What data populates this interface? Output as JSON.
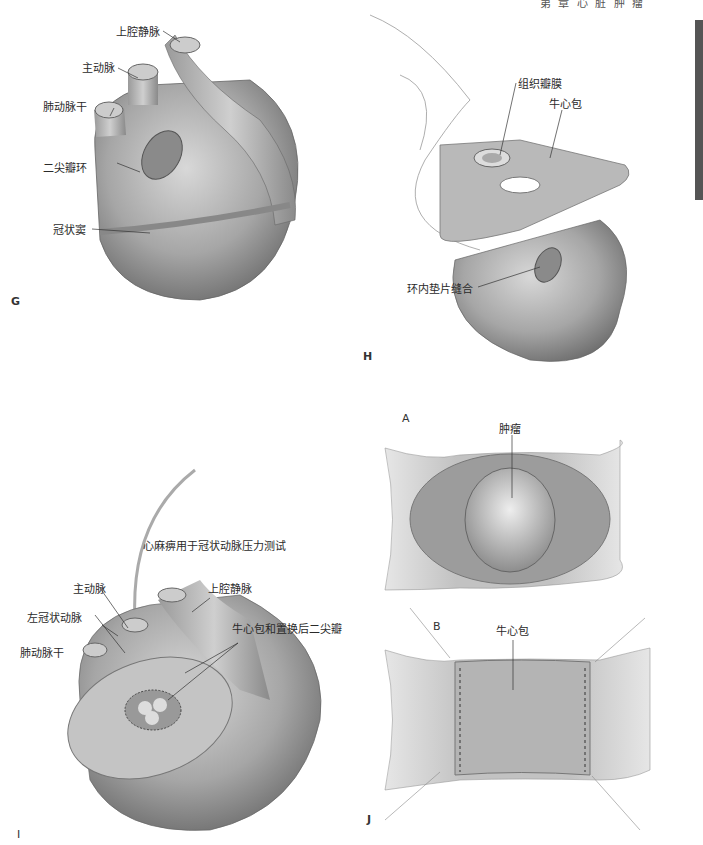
{
  "header": {
    "running_title": "第 章 心 脏 肿 瘤"
  },
  "panels": {
    "G": {
      "letter": "G",
      "labels": {
        "svc": "上腔静脉",
        "aorta": "主动脉",
        "pulmonary_trunk": "肺动脉干",
        "mitral_annulus": "二尖瓣环",
        "coronary_sinus": "冠状窦"
      }
    },
    "H": {
      "letter": "H",
      "labels": {
        "tissue_valve": "组织瓣膜",
        "bovine_pericardium": "牛心包",
        "pledget_suture": "环内垫片缝合"
      }
    },
    "I": {
      "letter": "I",
      "labels": {
        "cardioplegia": "心麻痹用于冠状动脉压力测试",
        "aorta": "主动脉",
        "svc": "上腔静脉",
        "left_coronary": "左冠状动脉",
        "patch_valve": "牛心包和置换后二尖瓣",
        "pulmonary_trunk": "肺动脉干"
      }
    },
    "J": {
      "letter": "J",
      "sub_a": {
        "letter": "A",
        "labels": {
          "tumor": "肿瘤"
        }
      },
      "sub_b": {
        "letter": "B",
        "labels": {
          "bovine_pericardium": "牛心包"
        }
      }
    }
  }
}
